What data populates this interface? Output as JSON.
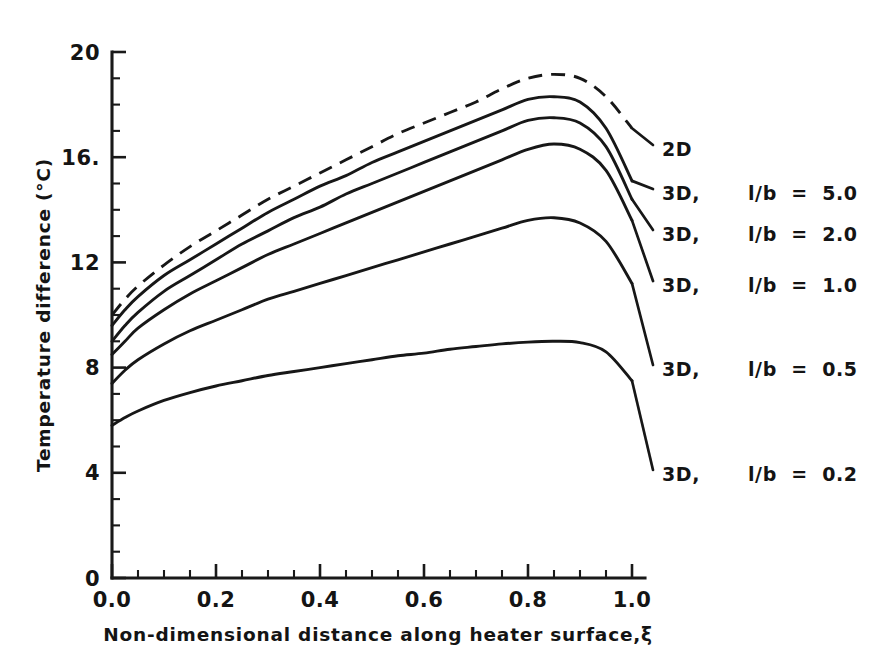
{
  "chart_data": {
    "type": "line",
    "title": "",
    "xlabel": "Non-dimensional distance along heater surface,ξ",
    "ylabel": "Temperature difference (°C)",
    "xlim": [
      0.0,
      1.0
    ],
    "ylim": [
      0,
      20
    ],
    "grid": false,
    "legend_position": "right-outside",
    "x_ticks": [
      "0.0",
      "0.2",
      "0.4",
      "0.6",
      "0.8",
      "1.0"
    ],
    "x_tick_values": [
      0.0,
      0.2,
      0.4,
      0.6,
      0.8,
      1.0
    ],
    "x_minor_step": 0.05,
    "y_ticks": [
      "0",
      "4",
      "8",
      "12",
      "16.",
      "20"
    ],
    "y_tick_values": [
      0,
      4,
      8,
      12,
      16,
      20
    ],
    "y_minor_step": 1,
    "x": [
      0.0,
      0.025,
      0.05,
      0.1,
      0.15,
      0.2,
      0.25,
      0.3,
      0.35,
      0.4,
      0.45,
      0.5,
      0.55,
      0.6,
      0.65,
      0.7,
      0.75,
      0.8,
      0.85,
      0.9,
      0.95,
      1.0
    ],
    "series": [
      {
        "name": "2D",
        "label": "2D",
        "style": "dashed",
        "values": [
          10.0,
          10.6,
          11.1,
          11.9,
          12.6,
          13.2,
          13.8,
          14.4,
          14.9,
          15.4,
          15.9,
          16.4,
          16.9,
          17.3,
          17.7,
          18.1,
          18.6,
          19.0,
          19.15,
          19.0,
          18.3,
          17.1
        ]
      },
      {
        "name": "3D l/b = 5.0",
        "label": "3D,",
        "ratio": "l/b  =  5.0",
        "style": "solid",
        "values": [
          9.6,
          10.2,
          10.7,
          11.5,
          12.1,
          12.7,
          13.3,
          13.9,
          14.4,
          14.9,
          15.3,
          15.8,
          16.2,
          16.6,
          17.0,
          17.4,
          17.8,
          18.2,
          18.3,
          18.1,
          17.1,
          15.1
        ]
      },
      {
        "name": "3D l/b = 2.0",
        "label": "3D,",
        "ratio": "l/b  =  2.0",
        "style": "solid",
        "values": [
          9.0,
          9.6,
          10.1,
          10.9,
          11.5,
          12.1,
          12.7,
          13.2,
          13.7,
          14.1,
          14.6,
          15.0,
          15.4,
          15.8,
          16.2,
          16.6,
          17.0,
          17.4,
          17.5,
          17.3,
          16.4,
          14.4
        ]
      },
      {
        "name": "3D l/b = 1.0",
        "label": "3D,",
        "ratio": "l/b  =  1.0",
        "style": "solid",
        "values": [
          8.5,
          9.0,
          9.5,
          10.2,
          10.8,
          11.3,
          11.8,
          12.3,
          12.7,
          13.1,
          13.5,
          13.9,
          14.3,
          14.7,
          15.1,
          15.5,
          15.9,
          16.3,
          16.5,
          16.3,
          15.5,
          13.6
        ]
      },
      {
        "name": "3D l/b = 0.5",
        "label": "3D,",
        "ratio": "l/b  =  0.5",
        "style": "solid",
        "values": [
          7.4,
          7.9,
          8.3,
          8.9,
          9.4,
          9.8,
          10.2,
          10.6,
          10.9,
          11.2,
          11.5,
          11.8,
          12.1,
          12.4,
          12.7,
          13.0,
          13.3,
          13.6,
          13.7,
          13.5,
          12.8,
          11.2
        ]
      },
      {
        "name": "3D l/b = 0.2",
        "label": "3D,",
        "ratio": "l/b  =  0.2",
        "style": "solid",
        "values": [
          5.8,
          6.1,
          6.35,
          6.75,
          7.05,
          7.3,
          7.5,
          7.7,
          7.85,
          8.0,
          8.15,
          8.3,
          8.45,
          8.55,
          8.7,
          8.8,
          8.9,
          8.97,
          9.0,
          8.95,
          8.6,
          7.5
        ]
      }
    ]
  },
  "legend": {
    "entries": [
      {
        "label": "2D",
        "ratio": ""
      },
      {
        "label": "3D,",
        "ratio": "l/b  =  5.0"
      },
      {
        "label": "3D,",
        "ratio": "l/b  =  2.0"
      },
      {
        "label": "3D,",
        "ratio": "l/b  =  1.0"
      },
      {
        "label": "3D,",
        "ratio": "l/b  =  0.5"
      },
      {
        "label": "3D,",
        "ratio": "l/b  =  0.2"
      }
    ]
  },
  "colors": {
    "background": "#ffffff",
    "ink": "#171717"
  }
}
